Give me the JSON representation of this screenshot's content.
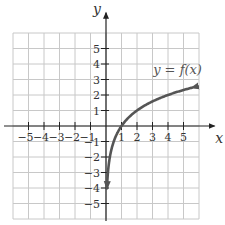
{
  "chart_data": {
    "type": "line",
    "title": "",
    "xlabel": "x",
    "ylabel": "y",
    "xlim": [
      -6,
      6
    ],
    "ylim": [
      -6,
      6
    ],
    "grid": true,
    "x_ticks": [
      -5,
      -4,
      -3,
      -2,
      -1,
      1,
      2,
      3,
      4,
      5
    ],
    "x_tick_labels": [
      "−5",
      "−4",
      "−3",
      "−2",
      "−1",
      "1",
      "2",
      "3",
      "4",
      "5"
    ],
    "y_ticks": [
      5,
      4,
      3,
      2,
      1,
      -1,
      -2,
      -3,
      -4,
      -5
    ],
    "y_tick_labels": [
      "5",
      "4",
      "3",
      "2",
      "1",
      "−1",
      "−2",
      "−3",
      "−4",
      "−5"
    ],
    "series": [
      {
        "name": "y = f(x)",
        "color": "#555555",
        "description": "increasing logarithmic-shaped curve, arrows at both ends",
        "x": [
          0.06,
          0.1,
          0.2,
          0.35,
          0.5,
          0.75,
          1,
          1.5,
          2,
          2.5,
          3,
          3.5,
          4,
          4.5,
          5,
          5.6
        ],
        "y": [
          -4.06,
          -3.32,
          -2.32,
          -1.51,
          -1.0,
          -0.42,
          0.0,
          0.58,
          1.0,
          1.32,
          1.58,
          1.81,
          2.0,
          2.17,
          2.32,
          2.49
        ]
      }
    ],
    "annotations": [
      {
        "text": "y = f(x)",
        "x": 3.3,
        "y": 3.6
      }
    ]
  },
  "labels": {
    "x_axis": "x",
    "y_axis": "y",
    "function": "y = f(x)"
  }
}
